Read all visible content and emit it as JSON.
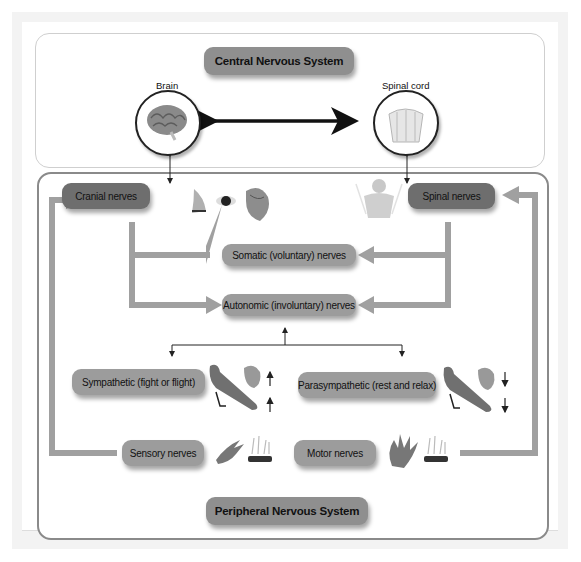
{
  "diagram": {
    "central": {
      "title": "Central Nervous System",
      "brain_label": "Brain",
      "spinal_cord_label": "Spinal cord"
    },
    "peripheral": {
      "title": "Peripheral Nervous System",
      "cranial": "Cranial nerves",
      "spinal": "Spinal nerves",
      "somatic": "Somatic (voluntary) nerves",
      "autonomic": "Autonomic (involuntary) nerves",
      "sympathetic": "Sympathetic (fight or flight)",
      "parasympathetic": "Parasympathetic (rest and relax)",
      "sensory": "Sensory nerves",
      "motor": "Motor nerves"
    },
    "icons": {
      "brain": "brain-icon",
      "spinal_cord": "spinal-cord-icon",
      "nose": "nose-icon",
      "eye": "eye-icon",
      "heart": "heart-icon",
      "torso": "torso-icon",
      "arm": "arm-icon",
      "hand": "hand-icon",
      "hot_surface": "hot-surface-icon",
      "arrow_up": "arrow-up-icon",
      "arrow_down": "arrow-down-icon"
    },
    "colors": {
      "dark_box": "#6e6e6e",
      "mid_box": "#9c9c9c",
      "connector": "#a0a0a0",
      "panel_border": "#8a8a8a"
    }
  }
}
